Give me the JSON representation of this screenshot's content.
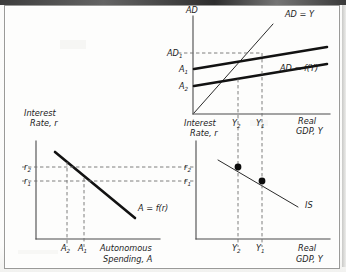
{
  "figure": {
    "type": "four-quadrant-economics-diagram",
    "background_color": "#fdfdfc",
    "ink_color": "#121212"
  },
  "panel_top_right": {
    "name": "aggregate-demand-45-degree-diagram",
    "y_axis_label": "AD",
    "x_axis_label_line1": "Real",
    "x_axis_label_line2": "GDP, Y",
    "y_tick_labels": [
      {
        "base": "AD",
        "sub": "1"
      },
      {
        "base": "A",
        "sub": "1"
      },
      {
        "base": "A",
        "sub": "2"
      }
    ],
    "x_tick_labels": [
      {
        "base": "Y",
        "sub": "2"
      },
      {
        "base": "Y",
        "sub": "1"
      }
    ],
    "curve_labels": [
      {
        "text": "AD = Y",
        "name": "forty-five-degree-line-label"
      },
      {
        "text": "AD = f(Y)",
        "name": "ad-function-label"
      }
    ]
  },
  "panel_bottom_left": {
    "name": "autonomous-spending-investment-demand",
    "y_axis_label_line1": "Interest",
    "y_axis_label_line2": "Rate, r",
    "x_axis_label_line1": "Autonomous",
    "x_axis_label_line2": "Spending, A",
    "y_tick_labels": [
      {
        "base": "r",
        "sub": "2"
      },
      {
        "base": "r",
        "sub": "1"
      }
    ],
    "x_tick_labels": [
      {
        "base": "A",
        "sub": "2"
      },
      {
        "base": "A",
        "sub": "1"
      }
    ],
    "curve_label": "A = f(r)"
  },
  "panel_bottom_right": {
    "name": "is-curve-diagram",
    "y_axis_label_line1": "Interest",
    "y_axis_label_line2": "Rate, r",
    "x_axis_label_line1": "Real",
    "x_axis_label_line2": "GDP, Y",
    "y_tick_labels": [
      {
        "base": "r",
        "sub": "2"
      },
      {
        "base": "r",
        "sub": "1"
      }
    ],
    "x_tick_labels_top": [
      {
        "base": "Y",
        "sub": "2"
      },
      {
        "base": "Y",
        "sub": "1"
      }
    ],
    "x_tick_labels_bottom": [
      {
        "base": "Y",
        "sub": "2"
      },
      {
        "base": "Y",
        "sub": "1"
      }
    ],
    "curve_label": "IS",
    "equilibrium_points": 2
  },
  "chart_data": {
    "type": "line",
    "panels": [
      {
        "id": "aggregate-demand",
        "position": "top-right",
        "xlabel": "Real GDP, Y",
        "ylabel": "AD",
        "grid": false,
        "xlim": [
          0,
          100
        ],
        "ylim": [
          0,
          100
        ],
        "series": [
          {
            "name": "AD = Y",
            "style": "thin-solid",
            "x": [
              0,
              92
            ],
            "y": [
              0,
              92
            ]
          },
          {
            "name": "AD = f(Y) high (A1)",
            "style": "bold-solid",
            "x": [
              0,
              100
            ],
            "y": [
              48,
              80
            ]
          },
          {
            "name": "AD = f(Y) low (A2)",
            "style": "bold-solid",
            "x": [
              0,
              100
            ],
            "y": [
              30,
              62
            ]
          }
        ],
        "ytick_values": [
          "AD1",
          "A1",
          "A2"
        ],
        "xtick_values": [
          "Y2",
          "Y1"
        ],
        "annotations": [
          "AD = Y",
          "AD = f(Y)"
        ]
      },
      {
        "id": "autonomous-spending",
        "position": "bottom-left",
        "xlabel": "Autonomous Spending, A",
        "ylabel": "Interest Rate, r",
        "grid": false,
        "series": [
          {
            "name": "A = f(r)",
            "style": "bold-solid",
            "x": [
              18,
              82
            ],
            "y": [
              88,
              18
            ]
          }
        ],
        "ytick_values": [
          "r2",
          "r1"
        ],
        "xtick_values": [
          "A2",
          "A1"
        ],
        "annotations": [
          "A = f(r)"
        ]
      },
      {
        "id": "is-curve",
        "position": "bottom-right",
        "xlabel": "Real GDP, Y",
        "ylabel": "Interest Rate, r",
        "grid": false,
        "series": [
          {
            "name": "IS",
            "style": "thin-solid",
            "x": [
              20,
              95
            ],
            "y": [
              82,
              18
            ]
          }
        ],
        "points": [
          {
            "label": "r2,Y2",
            "x": 33,
            "y": 70
          },
          {
            "label": "r1,Y1",
            "x": 57,
            "y": 52
          }
        ],
        "ytick_values": [
          "r2",
          "r1"
        ],
        "xtick_values": [
          "Y2",
          "Y1"
        ],
        "annotations": [
          "IS"
        ]
      }
    ]
  }
}
